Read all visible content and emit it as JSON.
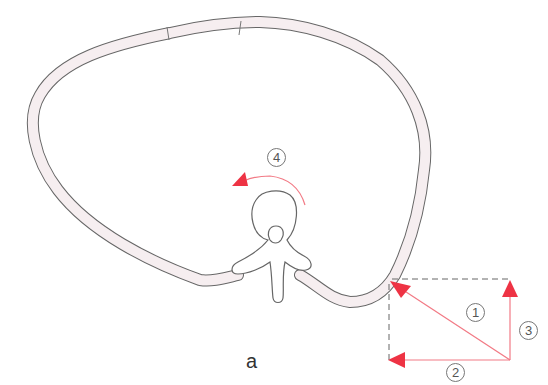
{
  "figure": {
    "caption": "a",
    "colors": {
      "outline": "#666666",
      "rib_fill": "#f6eef0",
      "vector": "#f27a85",
      "arrowhead": "#ee3344",
      "dashed": "#666666"
    },
    "labels": {
      "v1": "①",
      "v2": "②",
      "v3": "③",
      "v4": "④"
    },
    "label_text": {
      "v1": "1",
      "v2": "2",
      "v3": "3",
      "v4": "4"
    }
  }
}
